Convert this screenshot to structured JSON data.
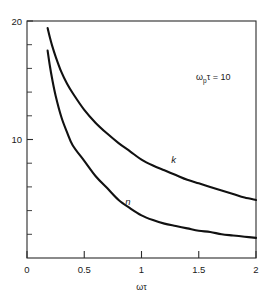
{
  "chart_data": {
    "type": "line",
    "title": "",
    "subtitle": "",
    "xlabel": "ωτ",
    "ylabel": "",
    "xlim": [
      0,
      2
    ],
    "ylim": [
      0,
      20
    ],
    "grid": false,
    "legend_position": "inline-curve-labels",
    "x_ticks": [
      "0",
      "0.5",
      "1",
      "1.5",
      "2"
    ],
    "x_tick_values": [
      0,
      0.5,
      1,
      1.5,
      2
    ],
    "y_ticks": [
      "10",
      "20"
    ],
    "y_tick_values": [
      10,
      20
    ],
    "y_minor_tick_values": [
      2,
      4,
      6,
      8,
      12,
      14,
      16,
      18
    ],
    "annotations": [
      {
        "name": "plasma-frequency-annotation",
        "prefix": "ω",
        "subscript": "p",
        "suffix": "τ = 10",
        "text": "ωpτ = 10"
      }
    ],
    "series": [
      {
        "name": "k",
        "label": "k",
        "x": [
          0.18,
          0.2,
          0.22,
          0.25,
          0.3,
          0.35,
          0.4,
          0.5,
          0.6,
          0.7,
          0.8,
          0.9,
          1.0,
          1.1,
          1.2,
          1.3,
          1.4,
          1.5,
          1.6,
          1.7,
          1.8,
          1.9,
          2.0
        ],
        "y": [
          19.4,
          18.6,
          17.9,
          17.0,
          15.7,
          14.7,
          13.9,
          12.5,
          11.4,
          10.5,
          9.7,
          9.0,
          8.3,
          7.8,
          7.4,
          7.0,
          6.6,
          6.3,
          6.0,
          5.7,
          5.4,
          5.1,
          4.9
        ]
      },
      {
        "name": "n",
        "label": "n",
        "x": [
          0.18,
          0.2,
          0.22,
          0.25,
          0.3,
          0.35,
          0.4,
          0.5,
          0.6,
          0.7,
          0.8,
          0.9,
          1.0,
          1.1,
          1.2,
          1.3,
          1.4,
          1.5,
          1.6,
          1.7,
          1.8,
          1.9,
          2.0
        ],
        "y": [
          17.5,
          16.2,
          15.1,
          13.7,
          11.9,
          10.6,
          9.5,
          8.2,
          6.9,
          5.9,
          4.9,
          4.2,
          3.6,
          3.2,
          2.9,
          2.7,
          2.5,
          2.3,
          2.2,
          2.0,
          1.9,
          1.8,
          1.7
        ]
      }
    ],
    "curve_label_positions": [
      {
        "series": "k",
        "x": 1.28,
        "y": 8.0
      },
      {
        "series": "n",
        "x": 0.88,
        "y": 4.5
      }
    ]
  }
}
